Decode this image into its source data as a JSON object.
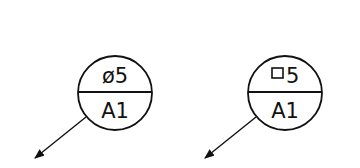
{
  "symbols": [
    {
      "name": "datum-target-circular",
      "top_text": "ø5",
      "bottom_text": "A1",
      "size_symbol": "diameter"
    },
    {
      "name": "datum-target-square",
      "top_text": "5",
      "bottom_text": "A1",
      "size_symbol": "square"
    }
  ],
  "colors": {
    "stroke": "#111111",
    "background": "#ffffff"
  }
}
